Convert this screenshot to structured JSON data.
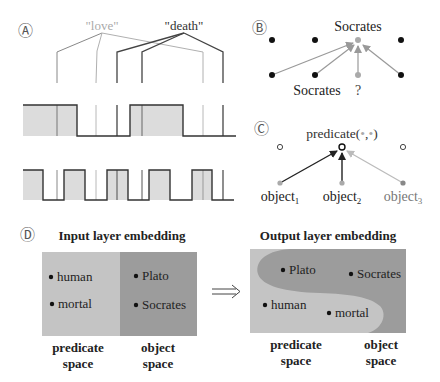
{
  "panel_a": {
    "label": "Ⓐ",
    "word_love": "\"love\"",
    "word_death": "\"death\"",
    "colors": {
      "love": "#aaaaaa",
      "death": "#333333",
      "fill": "#dcdcdc"
    }
  },
  "panel_b": {
    "label": "Ⓑ",
    "top_label": "Socrates",
    "bottom_label_left": "Socrates",
    "bottom_label_q": "?"
  },
  "panel_c": {
    "label": "Ⓒ",
    "predicate_label": "predicate(",
    "predicate_dot1": "•",
    "predicate_comma": ",",
    "predicate_dot2": "•",
    "predicate_close": ")",
    "objects": [
      {
        "name": "object",
        "sub": "1"
      },
      {
        "name": "object",
        "sub": "2"
      },
      {
        "name": "object",
        "sub": "3"
      }
    ]
  },
  "panel_d": {
    "label": "Ⓓ",
    "input_title": "Input layer embedding",
    "output_title": "Output layer embedding",
    "arrow": "⟹",
    "input_items": {
      "predicate": [
        "human",
        "mortal"
      ],
      "object": [
        "Plato",
        "Socrates"
      ]
    },
    "output_items": {
      "plato": "Plato",
      "socrates": "Socrates",
      "human": "human",
      "mortal": "mortal"
    },
    "space_labels": {
      "predicate_1": "predicate",
      "predicate_2": "space",
      "object_1": "object",
      "object_2": "space"
    },
    "colors": {
      "predicate_space": "#c4c4c4",
      "object_space": "#9c9c9c"
    }
  }
}
